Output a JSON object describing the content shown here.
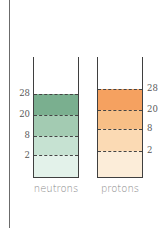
{
  "diagram": {
    "columns": [
      {
        "id": "neutrons",
        "label": "neutrons",
        "label_side": "left",
        "fill_top_y": 37,
        "levels": [
          {
            "value": "28",
            "y": 37
          },
          {
            "value": "20",
            "y": 58
          },
          {
            "value": "8",
            "y": 79
          },
          {
            "value": "2",
            "y": 98
          }
        ],
        "bands": [
          {
            "top": 37,
            "bottom": 58,
            "color": "#7aaf8f"
          },
          {
            "top": 58,
            "bottom": 79,
            "color": "#a3cbb2"
          },
          {
            "top": 79,
            "bottom": 98,
            "color": "#c6e2d2"
          },
          {
            "top": 98,
            "bottom": 121,
            "color": "#e3f2ea"
          }
        ]
      },
      {
        "id": "protons",
        "label": "protons",
        "label_side": "right",
        "fill_top_y": 32,
        "levels": [
          {
            "value": "28",
            "y": 32
          },
          {
            "value": "20",
            "y": 53
          },
          {
            "value": "8",
            "y": 72
          },
          {
            "value": "2",
            "y": 94
          }
        ],
        "bands": [
          {
            "top": 32,
            "bottom": 53,
            "color": "#f5a160"
          },
          {
            "top": 53,
            "bottom": 72,
            "color": "#f8bf86"
          },
          {
            "top": 72,
            "bottom": 94,
            "color": "#fbdab4"
          },
          {
            "top": 94,
            "bottom": 121,
            "color": "#fcedd9"
          }
        ]
      }
    ],
    "labels": {
      "neutrons": "neutrons",
      "protons": "protons",
      "n28": "28",
      "n20": "20",
      "n8": "8",
      "n2": "2",
      "p28": "28",
      "p20": "20",
      "p8": "8",
      "p2": "2"
    }
  }
}
